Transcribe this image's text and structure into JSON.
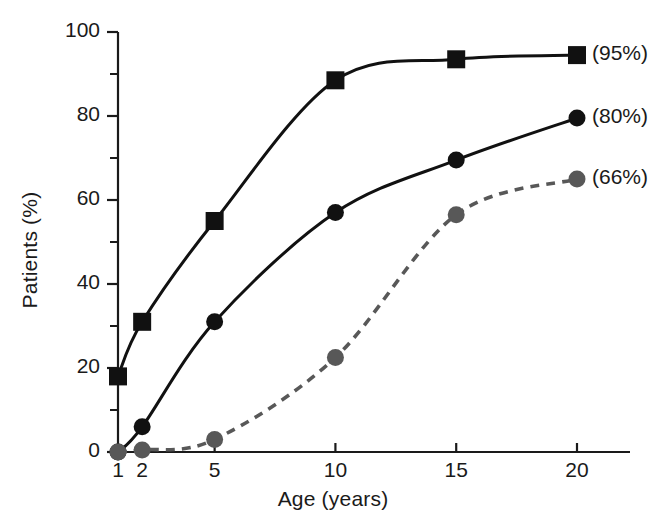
{
  "chart_data": {
    "type": "line",
    "title": "",
    "xlabel": "Age (years)",
    "ylabel": "Patients (%)",
    "x": [
      1,
      2,
      5,
      10,
      15,
      20
    ],
    "xtick_labels": [
      "1",
      "2",
      "5",
      "10",
      "15",
      "20"
    ],
    "ytick_labels": [
      "0",
      "20",
      "40",
      "60",
      "80",
      "100"
    ],
    "ytick_values": [
      0,
      20,
      40,
      60,
      80,
      100
    ],
    "yminor_values": [
      10,
      30,
      50,
      70,
      90
    ],
    "xlim": [
      1,
      20
    ],
    "ylim": [
      0,
      100
    ],
    "grid": false,
    "legend_position": "right-of-series-end",
    "series": [
      {
        "name": "(95%)",
        "label": "(95%)",
        "marker": "square",
        "color": "#111111",
        "linestyle": "solid",
        "values": [
          18,
          31,
          55,
          88.5,
          93.5,
          94.5
        ]
      },
      {
        "name": "(80%)",
        "label": "(80%)",
        "marker": "circle",
        "color": "#111111",
        "linestyle": "solid",
        "values": [
          0,
          6,
          31,
          57,
          69.5,
          79.5
        ]
      },
      {
        "name": "(66%)",
        "label": "(66%)",
        "marker": "circle",
        "color": "#585858",
        "linestyle": "dashed",
        "values": [
          0,
          0.5,
          3,
          22.5,
          56.5,
          65
        ]
      }
    ]
  },
  "axes": {
    "x_title": "Age (years)",
    "y_title": "Patients (%)"
  },
  "labels": {
    "series_1": "(95%)",
    "series_2": "(80%)",
    "series_3": "(66%)"
  }
}
